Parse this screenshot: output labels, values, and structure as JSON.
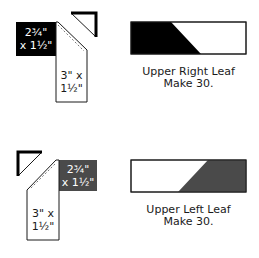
{
  "diagrams": [
    {
      "name": "upper-right-leaf",
      "pieces": {
        "rect_label_line1": "2¾\"",
        "rect_label_line2": "x 1½\"",
        "strip_label_line1": "3\" x",
        "strip_label_line2": "1½\""
      },
      "caption_line1": "Upper Right Leaf",
      "caption_line2": "Make 30.",
      "fill_color": "#000000"
    },
    {
      "name": "upper-left-leaf",
      "pieces": {
        "rect_label_line1": "2¾\"",
        "rect_label_line2": "x 1½\"",
        "strip_label_line1": "3\" x",
        "strip_label_line2": "1½\""
      },
      "caption_line1": "Upper Left Leaf",
      "caption_line2": "Make 30.",
      "fill_color": "#4a4a4a"
    }
  ],
  "colors": {
    "dark": "#000000",
    "gray": "#4a4a4a",
    "outline": "#1a1a1a",
    "background": "#ffffff"
  }
}
